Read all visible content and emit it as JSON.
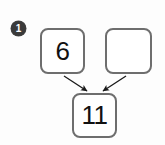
{
  "worksheet": {
    "item_number": "1",
    "marker_icon": "circled-number-badge",
    "type": "number-bond",
    "boxes": {
      "top_left": {
        "value": "6",
        "filled": true
      },
      "top_right": {
        "value": "",
        "filled": false
      },
      "bottom": {
        "value": "11",
        "filled": true
      }
    },
    "arrows": [
      {
        "name": "arrow-left-to-total",
        "from": "top_left",
        "to": "bottom",
        "direction": "down-right"
      },
      {
        "name": "arrow-right-to-total",
        "from": "top_right",
        "to": "bottom",
        "direction": "down-left"
      }
    ]
  },
  "colors": {
    "box_border": "#6e6e6e",
    "box_fill": "#ffffff",
    "text": "#111111",
    "marker_fill": "#3a3a3a",
    "marker_text": "#ffffff",
    "arrow": "#1a1a1a",
    "page_background": "#fdfdfd"
  }
}
